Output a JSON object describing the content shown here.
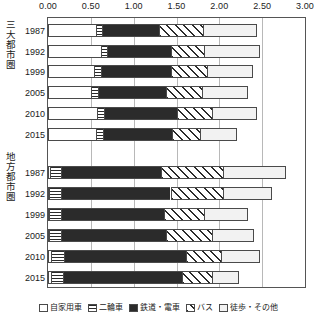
{
  "chart_data": {
    "type": "bar",
    "orientation": "horizontal",
    "stacked": true,
    "title": "",
    "xlabel": "",
    "ylabel": "",
    "xlim": [
      0.0,
      3.0
    ],
    "grid": true,
    "legend_position": "bottom",
    "xticks": [
      "0.00",
      "0.50",
      "1.00",
      "1.50",
      "2.00",
      "2.50",
      "3.00"
    ],
    "xtick_values": [
      0.0,
      0.5,
      1.0,
      1.5,
      2.0,
      2.5,
      3.0
    ],
    "series": [
      {
        "name": "自家用車",
        "pattern": "white"
      },
      {
        "name": "二輪車",
        "pattern": "horizontal-lines"
      },
      {
        "name": "鉄道・電車",
        "pattern": "solid-black"
      },
      {
        "name": "バス",
        "pattern": "diagonal-lines"
      },
      {
        "name": "徒歩・その他",
        "pattern": "dots"
      }
    ],
    "groups": [
      {
        "label": "三大都市圏",
        "categories": [
          "1987",
          "1992",
          "1999",
          "2005",
          "2010",
          "2015"
        ],
        "values": [
          [
            0.56,
            0.07,
            0.67,
            0.51,
            0.63
          ],
          [
            0.62,
            0.07,
            0.75,
            0.38,
            0.65
          ],
          [
            0.54,
            0.08,
            0.82,
            0.42,
            0.53
          ],
          [
            0.5,
            0.08,
            0.8,
            0.42,
            0.53
          ],
          [
            0.57,
            0.08,
            0.86,
            0.4,
            0.53
          ],
          [
            0.56,
            0.08,
            0.81,
            0.32,
            0.44
          ]
        ],
        "totals": [
          2.44,
          2.47,
          2.39,
          2.33,
          2.44,
          2.21
        ]
      },
      {
        "label": "地方都市圏",
        "categories": [
          "1987",
          "1992",
          "1999",
          "2005",
          "2010",
          "2015"
        ],
        "values": [
          [
            0.02,
            0.13,
            1.17,
            0.72,
            0.74
          ],
          [
            0.01,
            0.14,
            1.28,
            0.61,
            0.57
          ],
          [
            0.01,
            0.14,
            1.2,
            0.47,
            0.51
          ],
          [
            0.01,
            0.14,
            1.23,
            0.53,
            0.5
          ],
          [
            0.04,
            0.15,
            1.42,
            0.41,
            0.46
          ],
          [
            0.04,
            0.14,
            1.38,
            0.35,
            0.32
          ]
        ],
        "totals": [
          2.78,
          2.61,
          2.33,
          2.41,
          2.48,
          2.23
        ]
      }
    ]
  }
}
